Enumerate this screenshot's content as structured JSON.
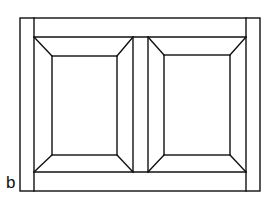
{
  "figure": {
    "label": "b",
    "stroke_color": "#111111",
    "background": "#ffffff"
  },
  "geometry": {
    "outer_frame": {
      "x1": 20,
      "y1": 18,
      "x2": 260,
      "y2": 191
    },
    "left_stile_inner_x": 34,
    "right_stile_inner_x": 246,
    "top_rail_y": 37,
    "bottom_rail_y": 172,
    "middle_stile": {
      "x_left": 133,
      "x_right": 148
    },
    "panels": [
      {
        "name": "left-panel",
        "outer": {
          "x1": 34,
          "y1": 37,
          "x2": 133,
          "y2": 172
        },
        "inner": {
          "x1": 52,
          "y1": 56,
          "x2": 117,
          "y2": 155
        }
      },
      {
        "name": "right-panel",
        "outer": {
          "x1": 148,
          "y1": 37,
          "x2": 246,
          "y2": 172
        },
        "inner": {
          "x1": 164,
          "y1": 55,
          "x2": 230,
          "y2": 155
        }
      }
    ]
  }
}
